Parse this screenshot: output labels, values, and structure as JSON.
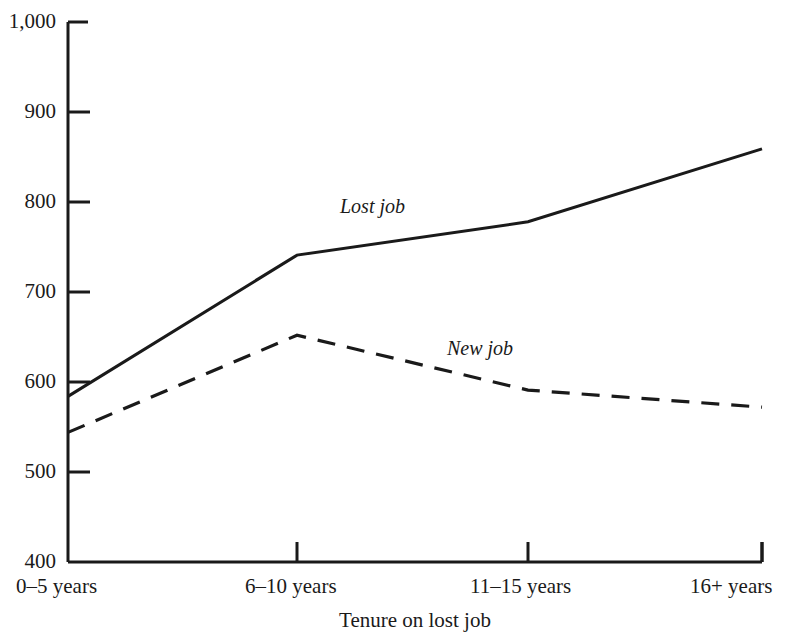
{
  "chart_data": {
    "type": "line",
    "title": "",
    "subtitle": "",
    "xlabel": "Tenure on lost job",
    "ylabel": "",
    "categories": [
      "0–5 years",
      "6–10 years",
      "11–15 years",
      "16+ years"
    ],
    "series": [
      {
        "name": "Lost job",
        "style": "solid",
        "values": [
          584,
          741,
          778,
          859
        ]
      },
      {
        "name": "New job",
        "style": "dashed",
        "values": [
          544,
          652,
          591,
          572
        ]
      }
    ],
    "ylim": [
      400,
      1000
    ],
    "yticks": [
      400,
      500,
      600,
      700,
      800,
      900,
      1000
    ],
    "ytick_labels": [
      "400",
      "500",
      "600",
      "700",
      "800",
      "900",
      "1,000"
    ],
    "grid": false,
    "legend": "inline-annotations",
    "annotations": [
      {
        "text": "Lost job",
        "series": "Lost job",
        "x_px": 340,
        "y_px": 196
      },
      {
        "text": "New job",
        "series": "New job",
        "x_px": 447,
        "y_px": 338
      }
    ],
    "axis_color": "#1a1a1a",
    "line_color": "#1a1a1a",
    "background_color": "#ffffff"
  },
  "plot_geometry": {
    "left_px": 68,
    "right_px": 762,
    "top_px": 22,
    "bottom_px": 562,
    "tick_x_px": [
      68,
      297,
      528,
      762
    ]
  }
}
